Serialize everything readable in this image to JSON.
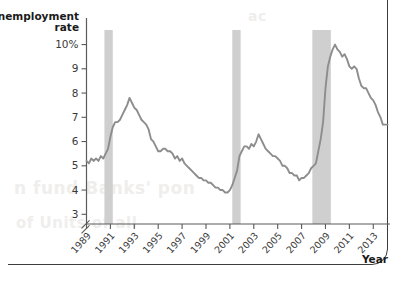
{
  "figure": {
    "frame_color": "#3d3d3d",
    "background": "#ffffff"
  },
  "bleed_text": {
    "line1": "n fund Banks' pon",
    "line2": "of Units of all",
    "line3": "ac"
  },
  "chart_data": {
    "type": "line",
    "title": "",
    "subtitle": "",
    "xlabel": "Year",
    "ylabel": "Unemployment rate",
    "ylabel_line1": "Unemployment",
    "ylabel_line2": "rate",
    "ylim": [
      2.6,
      10.6
    ],
    "xlim": [
      1989.0,
      2014.4
    ],
    "grid": false,
    "legend": null,
    "y_ticks": [
      3,
      4,
      5,
      6,
      7,
      8,
      9,
      10
    ],
    "y_tick_labels": [
      "3",
      "4",
      "5",
      "6",
      "7",
      "8",
      "9",
      "10%"
    ],
    "y_axis_break": true,
    "x_ticks": [
      1989,
      1991,
      1993,
      1995,
      1997,
      1999,
      2001,
      2003,
      2005,
      2007,
      2009,
      2011,
      2013
    ],
    "x_tick_labels": [
      "1989",
      "1991",
      "1993",
      "1995",
      "1997",
      "1999",
      "2001",
      "2003",
      "2005",
      "2007",
      "2009",
      "2011",
      "2013"
    ],
    "line_color": "#8d8d8d",
    "band_color": "#cfcfcf",
    "recession_bands": [
      {
        "label": "1990-91 recession",
        "start": 1990.5,
        "end": 1991.2
      },
      {
        "label": "2001 recession",
        "start": 2001.2,
        "end": 2001.9
      },
      {
        "label": "2007-09 recession",
        "start": 2007.9,
        "end": 2009.45
      }
    ],
    "series": [
      {
        "name": "Unemployment rate",
        "units": "percent",
        "x": [
          1989.0,
          1989.2,
          1989.4,
          1989.6,
          1989.8,
          1990.0,
          1990.2,
          1990.4,
          1990.6,
          1990.8,
          1991.0,
          1991.2,
          1991.4,
          1991.6,
          1991.8,
          1992.0,
          1992.2,
          1992.4,
          1992.6,
          1992.8,
          1993.0,
          1993.2,
          1993.4,
          1993.6,
          1993.8,
          1994.0,
          1994.2,
          1994.4,
          1994.6,
          1994.8,
          1995.0,
          1995.2,
          1995.4,
          1995.6,
          1995.8,
          1996.0,
          1996.2,
          1996.4,
          1996.6,
          1996.8,
          1997.0,
          1997.2,
          1997.4,
          1997.6,
          1997.8,
          1998.0,
          1998.2,
          1998.4,
          1998.6,
          1998.8,
          1999.0,
          1999.2,
          1999.4,
          1999.6,
          1999.8,
          2000.0,
          2000.2,
          2000.4,
          2000.6,
          2000.8,
          2001.0,
          2001.2,
          2001.4,
          2001.6,
          2001.8,
          2002.0,
          2002.2,
          2002.4,
          2002.6,
          2002.8,
          2003.0,
          2003.2,
          2003.4,
          2003.6,
          2003.8,
          2004.0,
          2004.2,
          2004.4,
          2004.6,
          2004.8,
          2005.0,
          2005.2,
          2005.4,
          2005.6,
          2005.8,
          2006.0,
          2006.2,
          2006.4,
          2006.6,
          2006.8,
          2007.0,
          2007.2,
          2007.4,
          2007.6,
          2007.8,
          2008.0,
          2008.2,
          2008.4,
          2008.6,
          2008.8,
          2009.0,
          2009.2,
          2009.4,
          2009.6,
          2009.8,
          2010.0,
          2010.2,
          2010.4,
          2010.6,
          2010.8,
          2011.0,
          2011.2,
          2011.4,
          2011.6,
          2011.8,
          2012.0,
          2012.2,
          2012.4,
          2012.6,
          2012.8,
          2013.0,
          2013.2,
          2013.4,
          2013.6,
          2013.8,
          2014.0,
          2014.2
        ],
        "y": [
          5.2,
          5.1,
          5.3,
          5.2,
          5.3,
          5.2,
          5.4,
          5.3,
          5.5,
          5.7,
          6.2,
          6.6,
          6.8,
          6.8,
          6.9,
          7.1,
          7.3,
          7.5,
          7.8,
          7.6,
          7.4,
          7.3,
          7.1,
          6.9,
          6.8,
          6.7,
          6.5,
          6.1,
          6.0,
          5.8,
          5.6,
          5.6,
          5.7,
          5.7,
          5.6,
          5.6,
          5.5,
          5.3,
          5.4,
          5.2,
          5.3,
          5.1,
          5.0,
          4.9,
          4.8,
          4.7,
          4.6,
          4.5,
          4.5,
          4.4,
          4.4,
          4.3,
          4.3,
          4.2,
          4.1,
          4.1,
          4.0,
          4.0,
          3.9,
          3.9,
          4.0,
          4.2,
          4.5,
          4.8,
          5.4,
          5.6,
          5.8,
          5.8,
          5.7,
          5.9,
          5.8,
          6.0,
          6.3,
          6.1,
          5.9,
          5.7,
          5.6,
          5.5,
          5.4,
          5.4,
          5.3,
          5.2,
          5.0,
          5.0,
          4.9,
          4.7,
          4.7,
          4.6,
          4.6,
          4.4,
          4.5,
          4.5,
          4.6,
          4.7,
          4.9,
          5.0,
          5.1,
          5.6,
          6.1,
          6.8,
          8.2,
          9.1,
          9.5,
          9.8,
          10.0,
          9.8,
          9.7,
          9.5,
          9.6,
          9.4,
          9.1,
          9.0,
          9.1,
          9.0,
          8.6,
          8.3,
          8.2,
          8.2,
          8.0,
          7.8,
          7.7,
          7.5,
          7.2,
          7.0,
          6.7,
          6.7,
          6.7
        ]
      }
    ],
    "annotations": {
      "start_value": 5.2,
      "peak_value": 10.0,
      "peak_year": 2009.8,
      "trough_value": 3.9,
      "trough_year": 2000.8,
      "end_value": 6.7,
      "end_year": 2014.2,
      "early_peak_value": 7.8,
      "early_peak_year": 1992.6,
      "mid_peak_value": 6.3,
      "mid_peak_year": 2003.4
    }
  }
}
